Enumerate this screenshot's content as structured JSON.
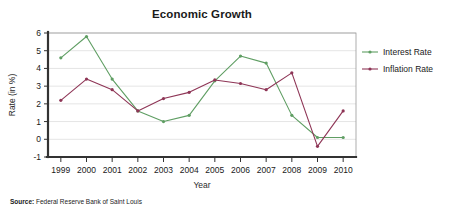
{
  "chart_data": {
    "type": "line",
    "title": "Economic Growth",
    "xlabel": "Year",
    "ylabel": "Rate (in %)",
    "categories": [
      "1999",
      "2000",
      "2001",
      "2002",
      "2003",
      "2004",
      "2005",
      "2006",
      "2007",
      "2008",
      "2009",
      "2010"
    ],
    "x": [
      1999,
      2000,
      2001,
      2002,
      2003,
      2004,
      2005,
      2006,
      2007,
      2008,
      2009,
      2010
    ],
    "series": [
      {
        "name": "Interest Rate",
        "color": "#5f9e63",
        "values": [
          4.6,
          5.8,
          3.4,
          1.6,
          1.0,
          1.35,
          3.3,
          4.7,
          4.3,
          1.35,
          0.1,
          0.1
        ]
      },
      {
        "name": "Inflation Rate",
        "color": "#8e3556",
        "values": [
          2.2,
          3.4,
          2.8,
          1.6,
          2.3,
          2.65,
          3.35,
          3.15,
          2.8,
          3.75,
          -0.4,
          1.6
        ]
      }
    ],
    "ylim": [
      -1,
      6
    ],
    "yticks": [
      -1,
      0,
      1,
      2,
      3,
      4,
      5,
      6
    ],
    "ytick_labels": [
      "-1",
      "0",
      "1",
      "2",
      "3",
      "4",
      "5",
      "6"
    ],
    "grid": true,
    "legend_position": "right"
  },
  "source": {
    "label": "Source:",
    "text": "Federal Reserve Bank of Saint Louis"
  }
}
